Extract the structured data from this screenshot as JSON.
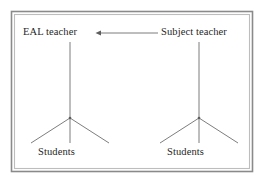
{
  "figure": {
    "background_color": "#ffffff",
    "frame": {
      "name": "outer-border-frame",
      "style": "double-rule",
      "outer_color": "#8a8a8a",
      "inner_color": "#b9b9b9",
      "x": 11,
      "y": 11,
      "width": 242,
      "height": 161
    },
    "line_color": "#6e6e6e",
    "text_color": "#1f1f1f"
  },
  "nodes": {
    "eal_teacher": {
      "label": "EAL teacher",
      "icon": "text-label",
      "x": 23,
      "y": 27
    },
    "subject_teacher": {
      "label": "Subject teacher",
      "icon": "text-label",
      "x": 161,
      "y": 27
    },
    "students_left": {
      "label": "Students",
      "icon": "text-label",
      "x": 38,
      "y": 147
    },
    "students_right": {
      "label": "Students",
      "icon": "text-label",
      "x": 167,
      "y": 147
    }
  },
  "connectors": {
    "arrow": {
      "name": "arrow-subject-to-eal",
      "direction": "right-to-left",
      "from": "Subject teacher",
      "to": "EAL teacher",
      "x1": 158,
      "y1": 33,
      "x2": 96,
      "y2": 33,
      "arrowhead_at": "left",
      "color": "#6e6e6e"
    },
    "left_tree": {
      "name": "eal-teacher-to-students-fan",
      "stem_x": 70,
      "stem_top_y": 42,
      "apex_y": 118,
      "legs_bottom_y": 143,
      "leg_left_x": 31,
      "leg_right_x": 109,
      "leg_count": 3
    },
    "right_tree": {
      "name": "subject-teacher-to-students-fan",
      "stem_x": 199,
      "stem_top_y": 42,
      "apex_y": 118,
      "legs_bottom_y": 143,
      "leg_left_x": 160,
      "leg_right_x": 238,
      "leg_count": 3
    }
  }
}
